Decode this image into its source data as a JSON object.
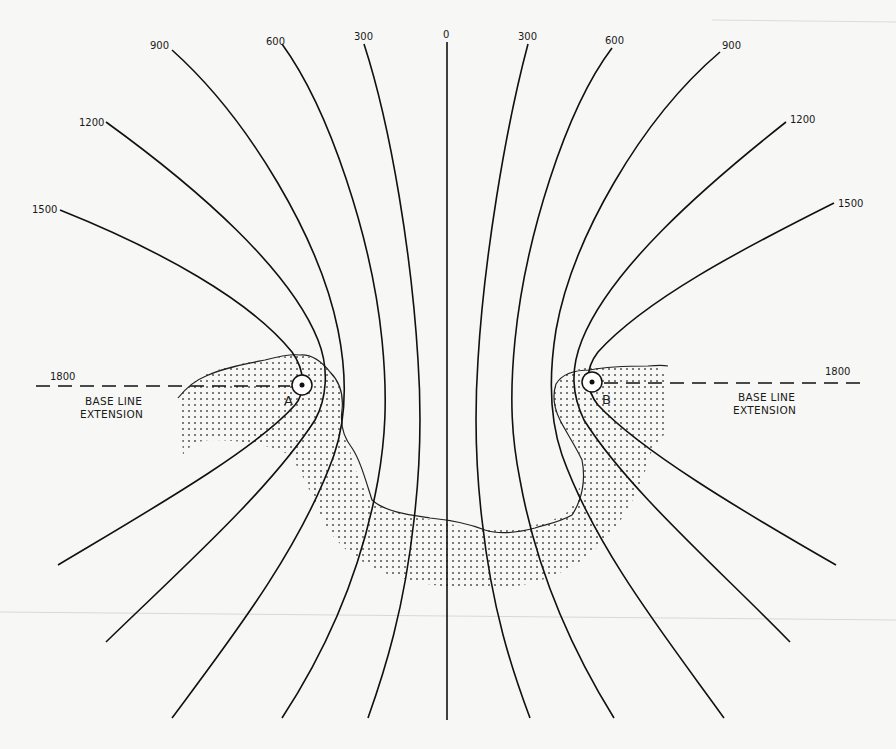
{
  "diagram": {
    "type": "hyperbolic-navigation-chart",
    "colors": {
      "line": "#111111",
      "background": "#f7f7f5",
      "stipple": "#333333"
    },
    "stations": [
      {
        "id": "A",
        "label": "A",
        "x": 302,
        "y": 385
      },
      {
        "id": "B",
        "label": "B",
        "x": 592,
        "y": 382
      }
    ],
    "baseline_extension": {
      "left": {
        "value_label": "1800",
        "caption_line1": "BASE LINE",
        "caption_line2": "EXTENSION"
      },
      "right": {
        "value_label": "1800",
        "caption_line1": "BASE LINE",
        "caption_line2": "EXTENSION"
      }
    },
    "lop_labels": {
      "left": [
        "1500",
        "1200",
        "900",
        "600",
        "300"
      ],
      "center": "0",
      "right": [
        "300",
        "600",
        "900",
        "1200",
        "1500"
      ]
    },
    "shaded_region": "land-mass (stippled)"
  }
}
